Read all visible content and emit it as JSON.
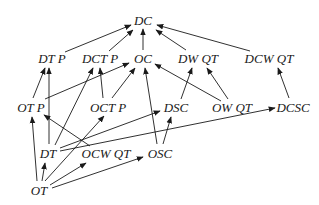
{
  "diagram": {
    "type": "directed-graph",
    "nodes": [
      {
        "id": "DC",
        "label": "DC",
        "x": 143,
        "y": 20
      },
      {
        "id": "DTP",
        "label": "DT P",
        "x": 52,
        "y": 58
      },
      {
        "id": "DCTP",
        "label": "DCT P",
        "x": 100,
        "y": 58
      },
      {
        "id": "OC",
        "label": "OC",
        "x": 143,
        "y": 58
      },
      {
        "id": "DWQT",
        "label": "DW QT",
        "x": 198,
        "y": 58
      },
      {
        "id": "DCWQT",
        "label": "DCW QT",
        "x": 269,
        "y": 58
      },
      {
        "id": "OTP",
        "label": "OT P",
        "x": 31,
        "y": 107
      },
      {
        "id": "OCTP",
        "label": "OCT P",
        "x": 108,
        "y": 107
      },
      {
        "id": "DSC",
        "label": "DSC",
        "x": 176,
        "y": 107
      },
      {
        "id": "OWQT",
        "label": "OW QT",
        "x": 232,
        "y": 107
      },
      {
        "id": "DCSC",
        "label": "DCSC",
        "x": 293,
        "y": 107
      },
      {
        "id": "DT",
        "label": "DT",
        "x": 48,
        "y": 153
      },
      {
        "id": "OCWQT",
        "label": "OCW QT",
        "x": 106,
        "y": 153
      },
      {
        "id": "OSC",
        "label": "OSC",
        "x": 160,
        "y": 153
      },
      {
        "id": "OT",
        "label": "OT",
        "x": 39,
        "y": 190
      }
    ],
    "edges": [
      {
        "from": "DTP",
        "to": "DC",
        "x1": 65,
        "y1": 52,
        "x2": 131,
        "y2": 25
      },
      {
        "from": "DCTP",
        "to": "DC",
        "x1": 109,
        "y1": 51,
        "x2": 133,
        "y2": 30
      },
      {
        "from": "OC",
        "to": "DC",
        "x1": 143,
        "y1": 50,
        "x2": 143,
        "y2": 29
      },
      {
        "from": "DWQT",
        "to": "DC",
        "x1": 186,
        "y1": 50,
        "x2": 156,
        "y2": 30
      },
      {
        "from": "DCWQT",
        "to": "DC",
        "x1": 250,
        "y1": 51,
        "x2": 157,
        "y2": 25
      },
      {
        "from": "OTP",
        "to": "DTP",
        "x1": 33,
        "y1": 98,
        "x2": 45,
        "y2": 68
      },
      {
        "from": "DT",
        "to": "DTP",
        "x1": 49,
        "y1": 144,
        "x2": 49,
        "y2": 68
      },
      {
        "from": "DT",
        "to": "DCTP",
        "x1": 55,
        "y1": 145,
        "x2": 93,
        "y2": 68
      },
      {
        "from": "OCTP",
        "to": "DCTP",
        "x1": 103,
        "y1": 98,
        "x2": 100,
        "y2": 68
      },
      {
        "from": "OCTP",
        "to": "OC",
        "x1": 112,
        "y1": 98,
        "x2": 135,
        "y2": 68
      },
      {
        "from": "OTP",
        "to": "OC",
        "x1": 45,
        "y1": 99,
        "x2": 129,
        "y2": 63
      },
      {
        "from": "OSC",
        "to": "OC",
        "x1": 157,
        "y1": 144,
        "x2": 145,
        "y2": 68
      },
      {
        "from": "OWQT",
        "to": "OC",
        "x1": 221,
        "y1": 101,
        "x2": 155,
        "y2": 64
      },
      {
        "from": "DSC",
        "to": "DWQT",
        "x1": 181,
        "y1": 99,
        "x2": 192,
        "y2": 68
      },
      {
        "from": "OWQT",
        "to": "DWQT",
        "x1": 228,
        "y1": 99,
        "x2": 207,
        "y2": 68
      },
      {
        "from": "DCSC",
        "to": "DCWQT",
        "x1": 289,
        "y1": 98,
        "x2": 278,
        "y2": 68
      },
      {
        "from": "OT",
        "to": "OTP",
        "x1": 37,
        "y1": 181,
        "x2": 32,
        "y2": 117
      },
      {
        "from": "OT",
        "to": "DT",
        "x1": 42,
        "y1": 181,
        "x2": 45,
        "y2": 163
      },
      {
        "from": "OT",
        "to": "OCTP",
        "x1": 45,
        "y1": 181,
        "x2": 104,
        "y2": 116
      },
      {
        "from": "OT",
        "to": "OCWQT",
        "x1": 50,
        "y1": 185,
        "x2": 86,
        "y2": 163
      },
      {
        "from": "OT",
        "to": "OSC",
        "x1": 52,
        "y1": 188,
        "x2": 143,
        "y2": 157
      },
      {
        "from": "OCWQT",
        "to": "OTP",
        "x1": 90,
        "y1": 146,
        "x2": 44,
        "y2": 115
      },
      {
        "from": "DT",
        "to": "DSC",
        "x1": 60,
        "y1": 148,
        "x2": 160,
        "y2": 111
      },
      {
        "from": "DT",
        "to": "DCSC",
        "x1": 60,
        "y1": 151,
        "x2": 275,
        "y2": 108
      },
      {
        "from": "OSC",
        "to": "DSC",
        "x1": 163,
        "y1": 144,
        "x2": 171,
        "y2": 117
      }
    ],
    "colors": {
      "background": "#ffffff",
      "stroke": "#1a1a1a",
      "text": "#1a1a1a"
    }
  }
}
